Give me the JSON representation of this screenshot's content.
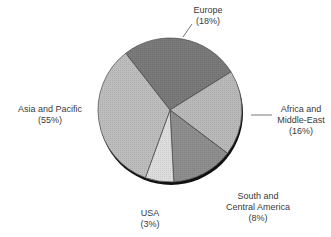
{
  "chart_data": {
    "type": "pie",
    "title": "",
    "categories": [
      "Europe",
      "Africa and Middle-East",
      "South and Central America",
      "USA",
      "Asia and Pacific"
    ],
    "values": [
      18,
      16,
      8,
      3,
      55
    ],
    "unit": "%",
    "labels": [
      {
        "line1": "Europe",
        "line2": "(18%)"
      },
      {
        "line1": "Africa and",
        "line2": "Middle-East",
        "line3": "(16%)"
      },
      {
        "line1": "South and",
        "line2": "Central America",
        "line3": "(8%)"
      },
      {
        "line1": "USA",
        "line2": "(3%)"
      },
      {
        "line1": "Asia and Pacific",
        "line2": "(55%)"
      }
    ],
    "colors": [
      "#7a7a7a",
      "#b9b9b9",
      "#8e8e8e",
      "#dddddd",
      "#bdbdbd"
    ],
    "legend": "none",
    "grid": false
  }
}
